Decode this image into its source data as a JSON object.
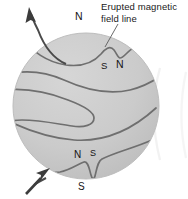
{
  "figure": {
    "type": "scientific-diagram",
    "callout": {
      "line1": "Erupted magnetic",
      "line2": "field line"
    },
    "poles": {
      "n_top": "N",
      "s_eruption_left": "S",
      "n_eruption_right": "N",
      "n_bottom_left": "N",
      "s_bottom_right": "S",
      "s_outside": "S"
    },
    "colors": {
      "sphere_fill": "#cccccc",
      "sphere_shade": "#c3c3c3",
      "field_line": "#6e6e6e",
      "arrow": "#3a3a3a",
      "text": "#141414",
      "background": "#ffffff",
      "neighbor_edge": "#e2e2e2"
    },
    "geometry": {
      "sphere_center_x": 86,
      "sphere_center_y": 106,
      "sphere_radius": 73
    },
    "arrows": [
      {
        "name": "upper-left-outflow",
        "direction": "up-left"
      },
      {
        "name": "lower-left-inflow",
        "direction": "up-right"
      }
    ]
  }
}
